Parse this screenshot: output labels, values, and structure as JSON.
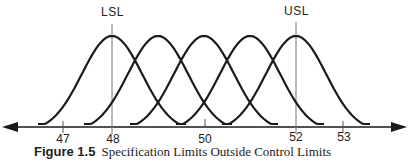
{
  "figure": {
    "caption_number": "Figure 1.5",
    "caption_text": "Specification Limits Outside Control Limits",
    "limits": [
      {
        "label": "LSL",
        "value": 48
      },
      {
        "label": "USL",
        "value": 52
      }
    ],
    "axis_ticks": [
      {
        "label": "47",
        "value": 47
      },
      {
        "label": "48",
        "value": 48
      },
      {
        "label": "50",
        "value": 50
      },
      {
        "label": "52",
        "value": 52
      },
      {
        "label": "53",
        "value": 53
      }
    ],
    "curves": [
      {
        "name": "distribution-1",
        "center": 48
      },
      {
        "name": "distribution-2",
        "center": 49
      },
      {
        "name": "distribution-3",
        "center": 50
      },
      {
        "name": "distribution-4",
        "center": 51
      },
      {
        "name": "distribution-5",
        "center": 52
      }
    ],
    "colors": {
      "line": "#1a1a1a",
      "limit_line": "#777777"
    }
  }
}
